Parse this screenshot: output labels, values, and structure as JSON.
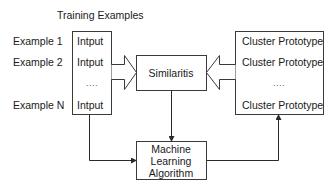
{
  "diagram": {
    "title": "Training Examples",
    "example_labels": [
      "Example 1",
      "Example 2",
      "Example N"
    ],
    "input_box": {
      "items": [
        "Intput",
        "Intput",
        "....",
        "Intput"
      ]
    },
    "similarity_box": {
      "label": "Similaritis"
    },
    "prototype_box": {
      "items": [
        "Cluster Prototype",
        "Cluster Prototype",
        "....",
        "Cluster Prototype"
      ]
    },
    "algorithm_box": {
      "lines": [
        "Machine",
        "Learning",
        "Algorithm"
      ]
    },
    "edges": [
      {
        "from": "input_box",
        "to": "similarity_box",
        "style": "hollow-arrow"
      },
      {
        "from": "prototype_box",
        "to": "similarity_box",
        "style": "hollow-arrow"
      },
      {
        "from": "similarity_box",
        "to": "algorithm_box",
        "style": "line-arrow"
      },
      {
        "from": "input_box",
        "to": "algorithm_box",
        "style": "elbow-arrow"
      },
      {
        "from": "algorithm_box",
        "to": "prototype_box",
        "style": "elbow-arrow"
      }
    ],
    "colors": {
      "stroke": "#3a3a3a",
      "text": "#1a1a1a",
      "background": "#ffffff"
    }
  }
}
